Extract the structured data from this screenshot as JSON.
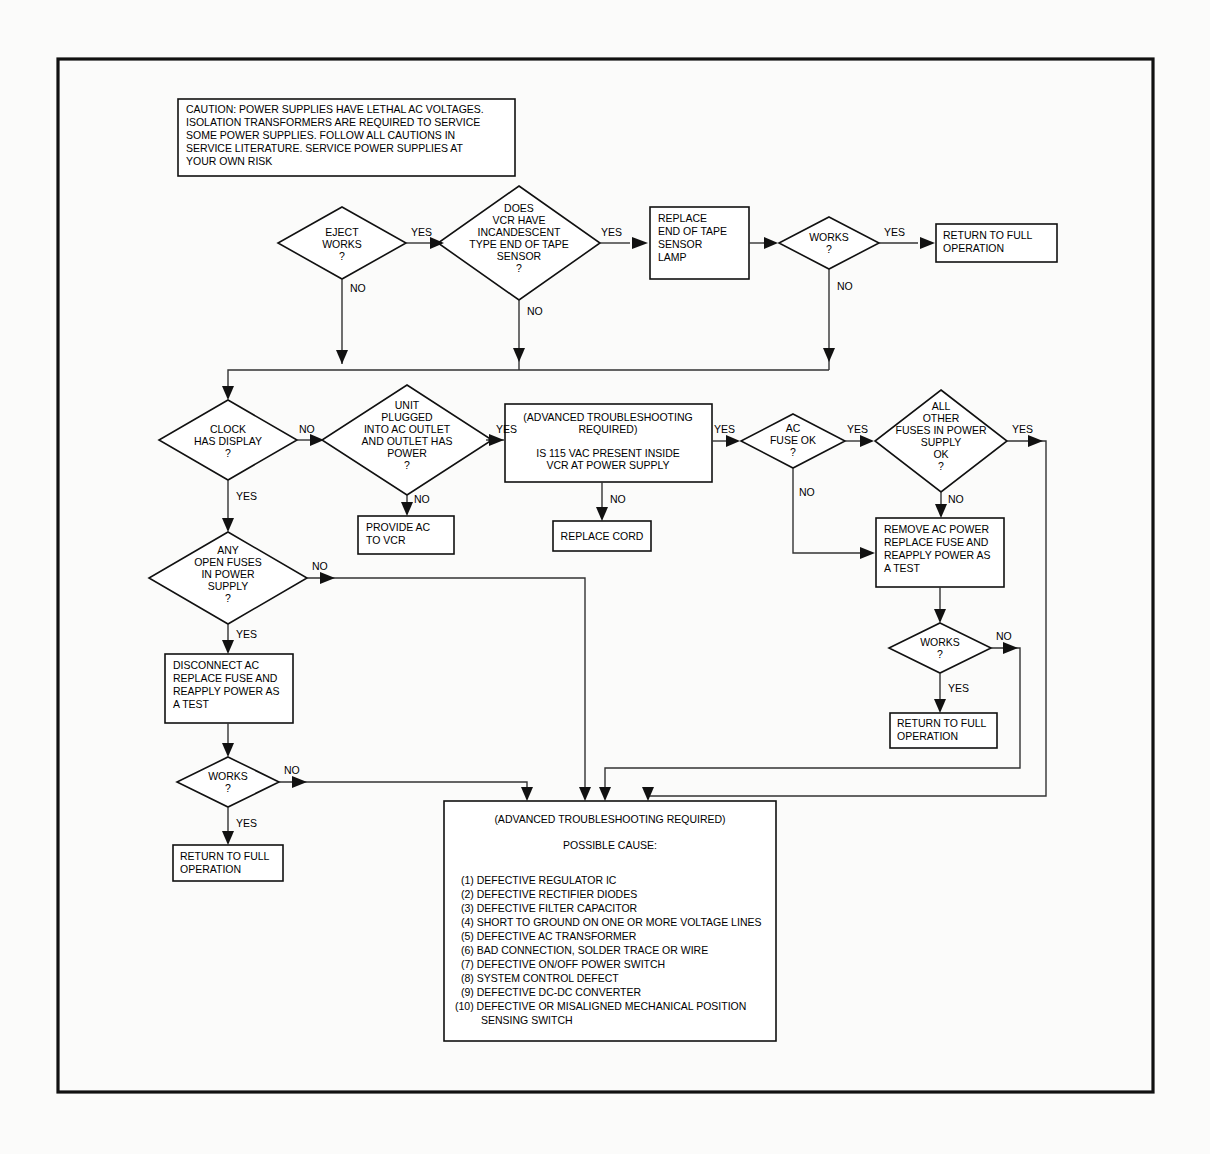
{
  "document": {
    "type": "troubleshooting-flowchart",
    "subject": "VCR Power Supply / Eject Troubleshooting Flowchart"
  },
  "caution": {
    "name": "caution-note",
    "lines": [
      "CAUTION: POWER SUPPLIES HAVE LETHAL AC VOLTAGES.",
      "ISOLATION TRANSFORMERS ARE REQUIRED TO SERVICE",
      "SOME POWER SUPPLIES. FOLLOW ALL CAUTIONS IN",
      "SERVICE LITERATURE. SERVICE POWER SUPPLIES AT",
      "YOUR OWN RISK"
    ]
  },
  "nodes": {
    "eject_works": {
      "shape": "decision",
      "lines": [
        "EJECT",
        "WORKS",
        "?"
      ]
    },
    "incandescent_sensor": {
      "shape": "decision",
      "lines": [
        "DOES",
        "VCR HAVE",
        "INCANDESCENT",
        "TYPE END OF TAPE",
        "SENSOR",
        "?"
      ]
    },
    "replace_lamp": {
      "shape": "process",
      "lines": [
        "REPLACE",
        "END OF TAPE",
        "SENSOR",
        "LAMP"
      ]
    },
    "works_top": {
      "shape": "decision",
      "lines": [
        "WORKS",
        "?"
      ]
    },
    "return_top": {
      "shape": "process",
      "lines": [
        "RETURN TO FULL",
        "OPERATION"
      ]
    },
    "clock_display": {
      "shape": "decision",
      "lines": [
        "CLOCK",
        "HAS DISPLAY",
        "?"
      ]
    },
    "unit_plugged": {
      "shape": "decision",
      "lines": [
        "UNIT",
        "PLUGGED",
        "INTO AC OUTLET",
        "AND OUTLET HAS",
        "POWER",
        "?"
      ]
    },
    "provide_ac": {
      "shape": "process",
      "lines": [
        "PROVIDE AC",
        "TO VCR"
      ]
    },
    "vac_present": {
      "shape": "process",
      "lines": [
        "(ADVANCED TROUBLESHOOTING",
        "REQUIRED)",
        "",
        "IS 115 VAC PRESENT INSIDE",
        "VCR AT POWER SUPPLY"
      ]
    },
    "replace_cord": {
      "shape": "process",
      "lines": [
        "REPLACE CORD"
      ]
    },
    "ac_fuse_ok": {
      "shape": "decision",
      "lines": [
        "AC",
        "FUSE OK",
        "?"
      ]
    },
    "all_other_fuses": {
      "shape": "decision",
      "lines": [
        "ALL",
        "OTHER",
        "FUSES IN POWER",
        "SUPPLY",
        "OK",
        "?"
      ]
    },
    "remove_ac_power": {
      "shape": "process",
      "lines": [
        "REMOVE AC POWER",
        "REPLACE FUSE AND",
        "REAPPLY POWER AS",
        "A TEST"
      ]
    },
    "works_right": {
      "shape": "decision",
      "lines": [
        "WORKS",
        "?"
      ]
    },
    "return_right": {
      "shape": "process",
      "lines": [
        "RETURN TO FULL",
        "OPERATION"
      ]
    },
    "any_open_fuses": {
      "shape": "decision",
      "lines": [
        "ANY",
        "OPEN FUSES",
        "IN POWER",
        "SUPPLY",
        "?"
      ]
    },
    "disconnect_ac": {
      "shape": "process",
      "lines": [
        "DISCONNECT AC",
        "REPLACE FUSE AND",
        "REAPPLY POWER AS",
        "A TEST"
      ]
    },
    "works_left": {
      "shape": "decision",
      "lines": [
        "WORKS",
        "?"
      ]
    },
    "return_left": {
      "shape": "process",
      "lines": [
        "RETURN TO FULL",
        "OPERATION"
      ]
    }
  },
  "possible_cause_box": {
    "header": "(ADVANCED TROUBLESHOOTING REQUIRED)",
    "subheader": "POSSIBLE CAUSE:",
    "causes": [
      "(1) DEFECTIVE REGULATOR IC",
      "(2) DEFECTIVE RECTIFIER DIODES",
      "(3) DEFECTIVE FILTER CAPACITOR",
      "(4) SHORT TO GROUND ON ONE OR MORE VOLTAGE LINES",
      "(5) DEFECTIVE AC TRANSFORMER",
      "(6) BAD CONNECTION, SOLDER TRACE OR WIRE",
      "(7) DEFECTIVE ON/OFF POWER SWITCH",
      "(8) SYSTEM CONTROL DEFECT",
      "(9) DEFECTIVE DC-DC CONVERTER",
      "(10) DEFECTIVE OR MISALIGNED MECHANICAL POSITION",
      "SENSING SWITCH"
    ]
  },
  "edge_labels": {
    "eject_yes": "YES",
    "eject_no": "NO",
    "sensor_yes": "YES",
    "sensor_no": "NO",
    "works_top_yes": "YES",
    "works_top_no": "NO",
    "clock_no": "NO",
    "clock_yes": "YES",
    "unit_yes": "YES",
    "unit_no": "NO",
    "vac_yes": "YES",
    "vac_no": "NO",
    "ac_fuse_yes": "YES",
    "ac_fuse_no": "NO",
    "all_fuses_yes": "YES",
    "all_fuses_no": "NO",
    "works_right_no": "NO",
    "works_right_yes": "YES",
    "any_open_no": "NO",
    "any_open_yes": "YES",
    "works_left_no": "NO",
    "works_left_yes": "YES"
  },
  "colors": {
    "stroke": "#111111",
    "connector": "#333333",
    "background": "#fbfbfa",
    "shape_fill": "#ffffff"
  }
}
